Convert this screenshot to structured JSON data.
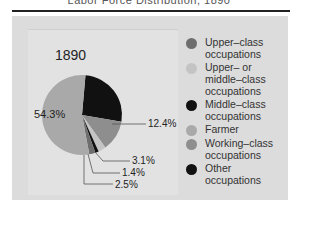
{
  "title": "Labor Force Distribution, 1890",
  "chart_data": {
    "type": "pie",
    "title": "1890",
    "slices": [
      {
        "label": "Other occupations",
        "value": 26.3,
        "color": "#111111",
        "labeled": false
      },
      {
        "label": "Working-class occupations",
        "value": 12.4,
        "color": "#8e8e8e",
        "labeled": true
      },
      {
        "label": "Upper- or middle-class occupations",
        "value": 3.1,
        "color": "#c4c4c4",
        "labeled": true
      },
      {
        "label": "Middle-class occupations",
        "value": 1.4,
        "color": "#111111",
        "labeled": true
      },
      {
        "label": "Upper-class occupations",
        "value": 2.5,
        "color": "#6e6e6e",
        "labeled": true
      },
      {
        "label": "Farmer",
        "value": 54.3,
        "color": "#a9a9a9",
        "labeled": true
      }
    ],
    "legend_position": "right"
  },
  "chart": {
    "year": "1890",
    "labels": {
      "farmer": "54.3%",
      "working": "12.4%",
      "uppermiddle": "3.1%",
      "middle": "1.4%",
      "upper": "2.5%"
    }
  },
  "legend": [
    {
      "label": "Upper–class\noccupations",
      "color": "#6e6e6e"
    },
    {
      "label": "Upper– or\nmiddle–class\noccupations",
      "color": "#c4c4c4"
    },
    {
      "label": "Middle–class\noccupations",
      "color": "#111111"
    },
    {
      "label": "Farmer",
      "color": "#a9a9a9"
    },
    {
      "label": "Working–class\noccupations",
      "color": "#8e8e8e"
    },
    {
      "label": "Other\noccupations",
      "color": "#111111"
    }
  ]
}
